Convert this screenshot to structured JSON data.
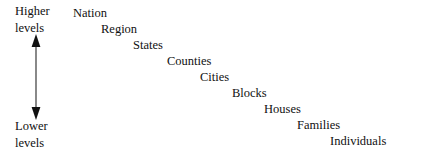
{
  "diagram": {
    "background_color": "#ffffff",
    "text_color": "#111111",
    "axis": {
      "name": "levels-axis",
      "top_caption_line1": "Higher",
      "top_caption_line2": "levels",
      "bottom_caption_line1": "Lower",
      "bottom_caption_line2": "levels",
      "arrow_color": "#3a3a3a",
      "arrow_style": "double-headed-vertical"
    },
    "levels": [
      {
        "label": "Nation",
        "x": 73,
        "y": 6
      },
      {
        "label": "Region",
        "x": 101,
        "y": 22
      },
      {
        "label": "States",
        "x": 133,
        "y": 38
      },
      {
        "label": "Counties",
        "x": 167,
        "y": 54
      },
      {
        "label": "Cities",
        "x": 200,
        "y": 70
      },
      {
        "label": "Blocks",
        "x": 232,
        "y": 86
      },
      {
        "label": "Houses",
        "x": 264,
        "y": 102
      },
      {
        "label": "Families",
        "x": 297,
        "y": 118
      },
      {
        "label": "Individuals",
        "x": 330,
        "y": 134
      }
    ]
  },
  "chart_data": {
    "type": "diagram",
    "orientation": "descending-staircase",
    "axis_label_high": "Higher levels",
    "axis_label_low": "Lower levels",
    "categories": [
      "Nation",
      "Region",
      "States",
      "Counties",
      "Cities",
      "Blocks",
      "Houses",
      "Families",
      "Individuals"
    ],
    "ranks": [
      1,
      2,
      3,
      4,
      5,
      6,
      7,
      8,
      9
    ]
  }
}
